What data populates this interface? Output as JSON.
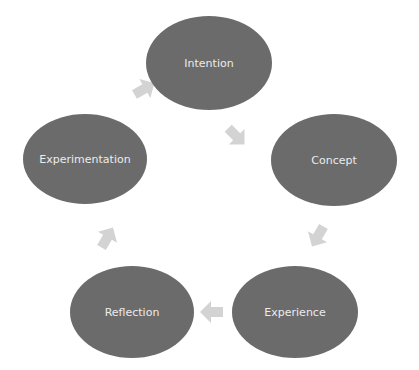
{
  "diagram": {
    "type": "cycle",
    "node_color": "#6b6b6b",
    "arrow_color": "#d3d3d3",
    "label_color": "#ececec",
    "nodes": [
      {
        "id": "intention",
        "label": "Intention"
      },
      {
        "id": "concept",
        "label": "Concept"
      },
      {
        "id": "experience",
        "label": "Experience"
      },
      {
        "id": "reflection",
        "label": "Reflection"
      },
      {
        "id": "experimentation",
        "label": "Experimentation"
      }
    ],
    "edges": [
      {
        "from": "intention",
        "to": "concept"
      },
      {
        "from": "concept",
        "to": "experience"
      },
      {
        "from": "experience",
        "to": "reflection"
      },
      {
        "from": "reflection",
        "to": "experimentation"
      },
      {
        "from": "experimentation",
        "to": "intention"
      }
    ]
  }
}
